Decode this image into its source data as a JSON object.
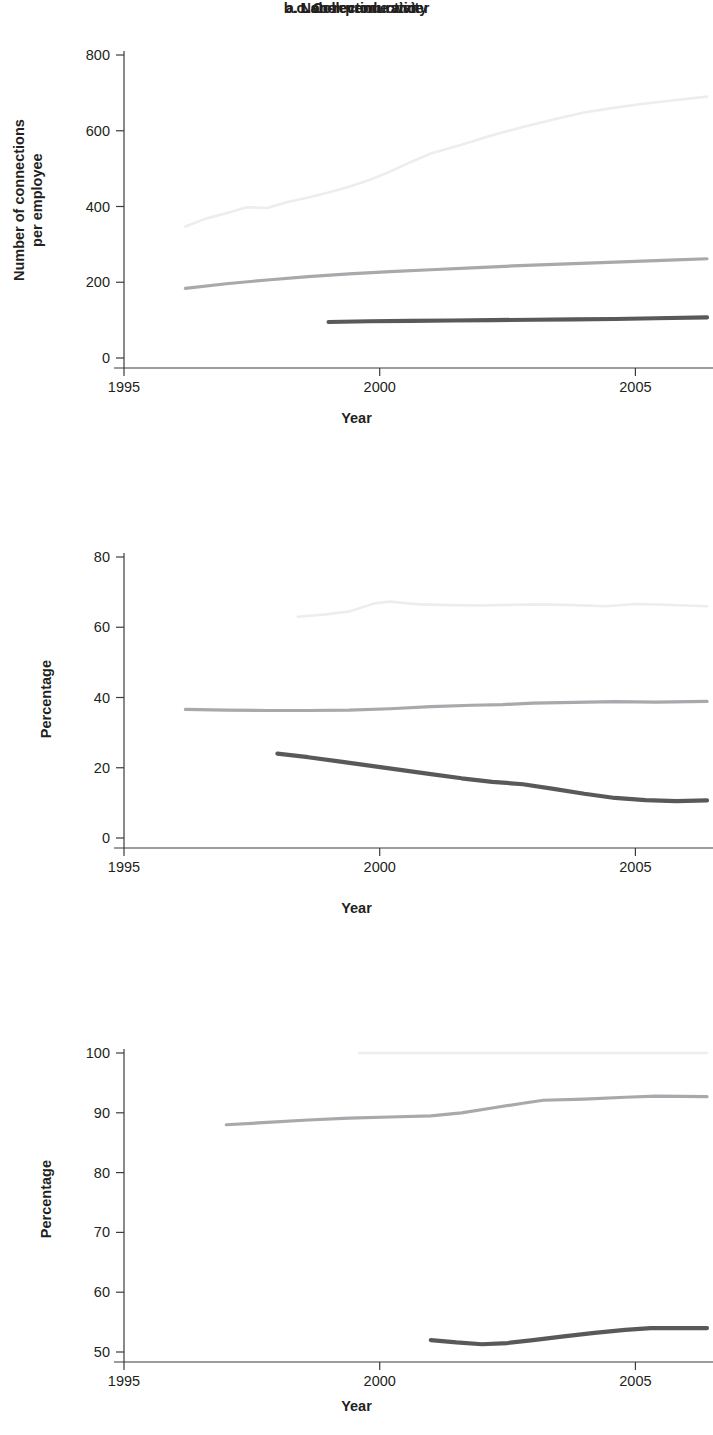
{
  "figure": {
    "xlabel": "Year",
    "panels": [
      {
        "key": "a",
        "title": "a. Labor productivity",
        "ylabel_line1": "Number of connections",
        "ylabel_line2": "per employee"
      },
      {
        "key": "b",
        "title": "b. Non-revenue water",
        "ylabel_line1": "Percentage",
        "ylabel_line2": ""
      },
      {
        "key": "c",
        "title": "c. Collection ratio",
        "ylabel_line1": "Percentage",
        "ylabel_line2": ""
      }
    ]
  },
  "colors": {
    "light_series": "#eceded",
    "mid_series": "#a7a9ac",
    "dark_series": "#58595b",
    "axis": "#3b3b3b",
    "text": "#231f20",
    "background": "#ffffff"
  },
  "chart_data": [
    {
      "type": "line",
      "title": "a. Labor productivity",
      "xlabel": "Year",
      "ylabel": "Number of connections per employee",
      "xlim": [
        1995,
        2006.4
      ],
      "ylim": [
        0,
        800
      ],
      "xticks": [
        1995,
        2000,
        2005
      ],
      "xtick_labels": [
        "1995",
        "2000",
        "2005"
      ],
      "yticks": [
        0,
        200,
        400,
        600,
        800
      ],
      "ytick_labels": [
        "0",
        "200",
        "400",
        "600",
        "800"
      ],
      "grid": false,
      "legend": "none",
      "series": [
        {
          "name": "light-series",
          "color": "#eceded",
          "x": [
            1996.2,
            1996.6,
            1997.0,
            1997.4,
            1997.8,
            1998.2,
            1998.6,
            1999.0,
            1999.4,
            1999.8,
            2000.2,
            2000.6,
            2001.0,
            2001.6,
            2002.2,
            2002.8,
            2003.4,
            2004.0,
            2004.6,
            2005.2,
            2005.8,
            2006.4
          ],
          "values": [
            347,
            368,
            382,
            398,
            396,
            412,
            424,
            437,
            452,
            470,
            492,
            517,
            540,
            563,
            588,
            610,
            630,
            648,
            661,
            672,
            681,
            690
          ]
        },
        {
          "name": "mid-series",
          "color": "#a7a9ac",
          "x": [
            1996.2,
            1997.0,
            1997.8,
            1998.6,
            1999.4,
            2000.2,
            2001.0,
            2001.8,
            2002.6,
            2003.4,
            2004.2,
            2005.0,
            2005.8,
            2006.4
          ],
          "values": [
            184,
            196,
            206,
            215,
            222,
            228,
            233,
            238,
            243,
            247,
            251,
            255,
            259,
            262
          ]
        },
        {
          "name": "dark-series",
          "color": "#58595b",
          "x": [
            1999.0,
            1999.8,
            2000.6,
            2001.4,
            2002.2,
            2003.0,
            2003.8,
            2004.6,
            2005.4,
            2006.4
          ],
          "values": [
            95,
            97,
            98,
            99,
            100,
            101,
            102,
            103,
            105,
            107
          ]
        }
      ]
    },
    {
      "type": "line",
      "title": "b. Non-revenue water",
      "xlabel": "Year",
      "ylabel": "Percentage",
      "xlim": [
        1995,
        2006.4
      ],
      "ylim": [
        0,
        80
      ],
      "xticks": [
        1995,
        2000,
        2005
      ],
      "xtick_labels": [
        "1995",
        "2000",
        "2005"
      ],
      "yticks": [
        0,
        20,
        40,
        60,
        80
      ],
      "ytick_labels": [
        "0",
        "20",
        "40",
        "60",
        "80"
      ],
      "grid": false,
      "legend": "none",
      "series": [
        {
          "name": "light-series",
          "color": "#eceded",
          "x": [
            1998.4,
            1998.9,
            1999.4,
            1999.9,
            2000.2,
            2000.8,
            2001.4,
            2002.0,
            2002.6,
            2003.2,
            2003.8,
            2004.4,
            2005.0,
            2005.6,
            2006.4
          ],
          "values": [
            63.0,
            63.6,
            64.5,
            66.8,
            67.3,
            66.5,
            66.3,
            66.2,
            66.4,
            66.5,
            66.3,
            66.0,
            66.6,
            66.4,
            66.0
          ]
        },
        {
          "name": "mid-series",
          "color": "#a7a9ac",
          "x": [
            1996.2,
            1997.0,
            1997.8,
            1998.6,
            1999.4,
            2000.2,
            2001.0,
            2001.8,
            2002.4,
            2003.0,
            2003.8,
            2004.6,
            2005.4,
            2006.4
          ],
          "values": [
            36.6,
            36.4,
            36.3,
            36.3,
            36.4,
            36.8,
            37.4,
            37.8,
            38.0,
            38.4,
            38.6,
            38.8,
            38.7,
            38.9
          ]
        },
        {
          "name": "dark-series",
          "color": "#58595b",
          "x": [
            1998.0,
            1998.6,
            1999.2,
            1999.8,
            2000.4,
            2001.0,
            2001.6,
            2002.2,
            2002.8,
            2003.4,
            2004.0,
            2004.6,
            2005.2,
            2005.8,
            2006.4
          ],
          "values": [
            24.0,
            23.0,
            21.8,
            20.6,
            19.4,
            18.2,
            17.0,
            16.0,
            15.3,
            14.0,
            12.6,
            11.4,
            10.8,
            10.5,
            10.7
          ]
        }
      ]
    },
    {
      "type": "line",
      "title": "c. Collection ratio",
      "xlabel": "Year",
      "ylabel": "Percentage",
      "xlim": [
        1995,
        2006.4
      ],
      "ylim": [
        50,
        100
      ],
      "xticks": [
        1995,
        2000,
        2005
      ],
      "xtick_labels": [
        "1995",
        "2000",
        "2005"
      ],
      "yticks": [
        50,
        60,
        70,
        80,
        90,
        100
      ],
      "ytick_labels": [
        "50",
        "60",
        "70",
        "80",
        "90",
        "100"
      ],
      "grid": false,
      "legend": "none",
      "series": [
        {
          "name": "light-series",
          "color": "#eceded",
          "x": [
            1999.6,
            2000.5,
            2001.5,
            2002.5,
            2003.5,
            2004.5,
            2005.5,
            2006.4
          ],
          "values": [
            100,
            100,
            100,
            100,
            100,
            100,
            100,
            100
          ]
        },
        {
          "name": "mid-series",
          "color": "#a7a9ac",
          "x": [
            1997.0,
            1997.8,
            1998.6,
            1999.4,
            2000.2,
            2001.0,
            2001.6,
            2002.2,
            2002.8,
            2003.2,
            2004.0,
            2004.8,
            2005.4,
            2006.4
          ],
          "values": [
            88.0,
            88.4,
            88.8,
            89.1,
            89.3,
            89.5,
            90.0,
            90.8,
            91.6,
            92.1,
            92.3,
            92.6,
            92.8,
            92.7
          ]
        },
        {
          "name": "dark-series",
          "color": "#58595b",
          "x": [
            2001.0,
            2001.5,
            2002.0,
            2002.5,
            2003.0,
            2003.6,
            2004.2,
            2004.8,
            2005.3,
            2005.9,
            2006.4
          ],
          "values": [
            52.0,
            51.6,
            51.3,
            51.5,
            52.0,
            52.6,
            53.2,
            53.7,
            54.0,
            54.0,
            54.0
          ]
        }
      ]
    }
  ]
}
